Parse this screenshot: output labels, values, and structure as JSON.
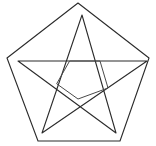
{
  "figure": {
    "title": "Pentagon with inscribed five-pointed star",
    "background_color": "#ffffff",
    "stroke_color": "#2b2b2b",
    "stroke_color_light": "#4a4a4a",
    "stroke_width": 1.1,
    "canvas": {
      "width": 156,
      "height": 146
    },
    "shapes": {
      "pentagon": {
        "name": "outer-pentagon",
        "closed": true,
        "points": [
          [
            78,
            3
          ],
          [
            149,
            58
          ],
          [
            120,
            141
          ],
          [
            38,
            141
          ],
          [
            7,
            58
          ]
        ]
      },
      "pentagram": {
        "name": "inscribed-star",
        "closed": true,
        "points": [
          [
            82,
            15
          ],
          [
            116,
            133
          ],
          [
            18,
            61
          ],
          [
            147,
            61
          ],
          [
            42,
            133
          ]
        ]
      },
      "inner_pentagon": {
        "name": "star-inner-pentagon",
        "closed": true,
        "points": [
          [
            70,
            61
          ],
          [
            100,
            61
          ],
          [
            108,
            88
          ],
          [
            78,
            99
          ],
          [
            57,
            84
          ]
        ]
      }
    }
  }
}
